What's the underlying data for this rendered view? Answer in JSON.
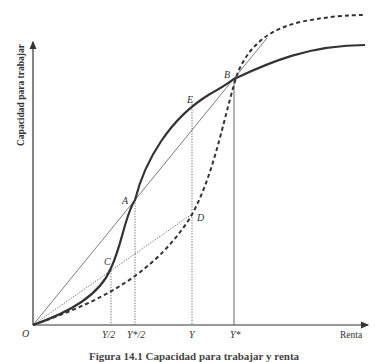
{
  "diagram": {
    "y_axis_label": "Capacidad para trabajar",
    "x_axis_label": "Renta",
    "origin_label": "O",
    "tick_labels": {
      "y_half": "Y/2",
      "ystar_half": "Y*/2",
      "y": "Y",
      "ystar": "Y*"
    },
    "points": {
      "A": "A",
      "B": "B",
      "C": "C",
      "D": "D",
      "E": "E"
    },
    "curves": [
      {
        "name": "solid S-shaped curve",
        "style": "solid-thick"
      },
      {
        "name": "dashed convex curve",
        "style": "dashed-thick"
      },
      {
        "name": "line O-B through A",
        "style": "solid-thin"
      },
      {
        "name": "line O-D through C",
        "style": "dotted-thin"
      }
    ],
    "caption": "Figura 14.1 Capacidad para trabajar y renta"
  }
}
